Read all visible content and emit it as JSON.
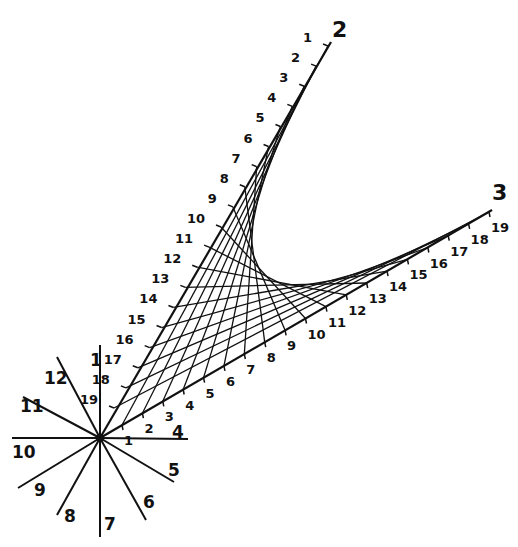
{
  "diagram": {
    "type": "curve-stitching",
    "colors": {
      "ink": "#111111",
      "background": "#ffffff"
    },
    "center": [
      100,
      438
    ],
    "star_rays": [
      {
        "label": "1",
        "end": [
          100,
          345
        ],
        "label_pos": [
          90,
          366
        ]
      },
      {
        "label": "12",
        "end": [
          57,
          357
        ],
        "label_pos": [
          44,
          384
        ]
      },
      {
        "label": "11",
        "end": [
          23,
          397
        ],
        "label_pos": [
          20,
          412
        ]
      },
      {
        "label": "10",
        "end": [
          12,
          438
        ],
        "label_pos": [
          12,
          458
        ]
      },
      {
        "label": "9",
        "end": [
          18,
          488
        ],
        "label_pos": [
          34,
          496
        ]
      },
      {
        "label": "8",
        "end": [
          57,
          515
        ],
        "label_pos": [
          64,
          522
        ]
      },
      {
        "label": "7",
        "end": [
          100,
          537
        ],
        "label_pos": [
          104,
          530
        ]
      },
      {
        "label": "6",
        "end": [
          146,
          520
        ],
        "label_pos": [
          143,
          508
        ]
      },
      {
        "label": "5",
        "end": [
          174,
          482
        ],
        "label_pos": [
          168,
          476
        ]
      },
      {
        "label": "4",
        "end": [
          188,
          439
        ],
        "label_pos": [
          172,
          438
        ]
      }
    ],
    "axis_a": {
      "name": "2",
      "name_pos": [
        332,
        37
      ],
      "start_tick": [
        328,
        46
      ],
      "end_tick": [
        114,
        408
      ],
      "line_end": [
        331,
        42
      ],
      "tick_labels": [
        "1",
        "2",
        "3",
        "4",
        "5",
        "6",
        "7",
        "8",
        "9",
        "10",
        "11",
        "12",
        "13",
        "14",
        "15",
        "16",
        "17",
        "18",
        "19"
      ],
      "label_offset": [
        -16,
        -4
      ]
    },
    "axis_b": {
      "name": "3",
      "name_pos": [
        492,
        200
      ],
      "start_tick": [
        122,
        425
      ],
      "end_tick": [
        489,
        212
      ],
      "line_end": [
        492,
        210
      ],
      "tick_labels": [
        "1",
        "2",
        "3",
        "4",
        "5",
        "6",
        "7",
        "8",
        "9",
        "10",
        "11",
        "12",
        "13",
        "14",
        "15",
        "16",
        "17",
        "18",
        "19"
      ],
      "label_offset": [
        2,
        20
      ]
    },
    "connections": "tick i on axis 2 joined to tick i on axis 3, i = 1..19"
  }
}
